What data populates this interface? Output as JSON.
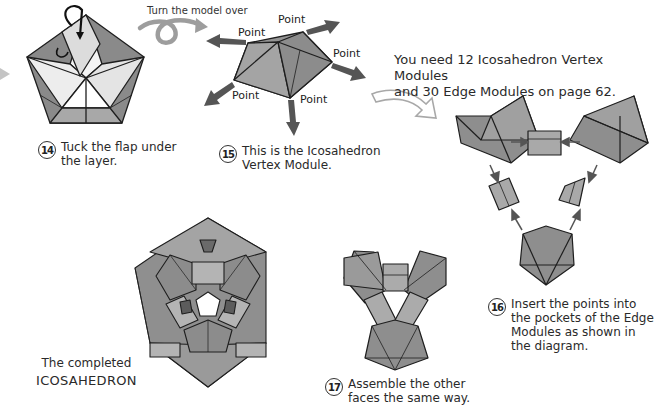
{
  "header": {
    "turn_over_label": "Turn the model over",
    "requirement_line1": "You need 12 Icosahedron Vertex Modules",
    "requirement_line2": "and 30 Edge Modules on page 62."
  },
  "vertex_module": {
    "point_labels": [
      "Point",
      "Point",
      "Point",
      "Point",
      "Point"
    ]
  },
  "steps": [
    {
      "number": "14",
      "lines": [
        "Tuck the flap under",
        "the layer."
      ]
    },
    {
      "number": "15",
      "lines": [
        "This is the Icosahedron",
        "Vertex Module."
      ]
    },
    {
      "number": "16",
      "lines": [
        "Insert the points into",
        "the pockets of the Edge",
        "Modules as shown in",
        "the diagram."
      ]
    },
    {
      "number": "17",
      "lines": [
        "Assemble the other",
        "faces the same way."
      ]
    }
  ],
  "completed": {
    "line1": "The completed",
    "line2": "ICOSAHEDRON"
  },
  "colors": {
    "paper_dark": "#7f7f7f",
    "paper_mid": "#9a9a9a",
    "paper_light": "#bdbdbd",
    "paper_white": "#f2f2f2",
    "arrow_dark": "#555555",
    "arrow_light": "#b0b0b0",
    "outline": "#1e1e1e"
  }
}
